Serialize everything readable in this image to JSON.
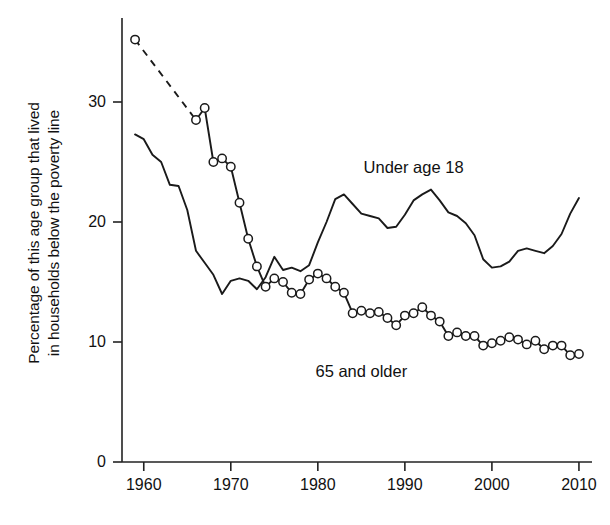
{
  "chart_data": {
    "type": "line",
    "title": "",
    "subtitle": "",
    "xlabel": "",
    "ylabel": "Percentage of this age group that lived in households below the poverty line",
    "ylabel_line1": "Percentage of this age group that lived",
    "ylabel_line2": "in households below the poverty line",
    "xlim": [
      1957.5,
      2011.5
    ],
    "ylim": [
      0,
      37
    ],
    "xticks": [
      1960,
      1970,
      1980,
      1990,
      2000,
      2010
    ],
    "yticks": [
      0,
      10,
      20,
      30
    ],
    "xtick_labels": [
      "1960",
      "1970",
      "1980",
      "1990",
      "2000",
      "2010"
    ],
    "ytick_labels": [
      "0",
      "10",
      "20",
      "30"
    ],
    "grid": false,
    "legend_position": "inline-annotations",
    "annotations": [
      {
        "text": "Under age 18",
        "x": 1991.0,
        "y": 24.6
      },
      {
        "text": "65 and older",
        "x": 1985.0,
        "y": 7.6
      }
    ],
    "series": [
      {
        "name": "Under age 18",
        "marker": "none",
        "line_style": "solid",
        "color": "#1a1a1a",
        "x": [
          1959,
          1960,
          1961,
          1962,
          1963,
          1964,
          1965,
          1966,
          1967,
          1968,
          1969,
          1970,
          1971,
          1972,
          1973,
          1974,
          1975,
          1976,
          1977,
          1978,
          1979,
          1980,
          1981,
          1982,
          1983,
          1984,
          1985,
          1986,
          1987,
          1988,
          1989,
          1990,
          1991,
          1992,
          1993,
          1994,
          1995,
          1996,
          1997,
          1998,
          1999,
          2000,
          2001,
          2002,
          2003,
          2004,
          2005,
          2006,
          2007,
          2008,
          2009,
          2010
        ],
        "values": [
          27.3,
          26.9,
          25.6,
          25.0,
          23.1,
          23.0,
          21.0,
          17.6,
          16.6,
          15.6,
          14.0,
          15.1,
          15.3,
          15.1,
          14.4,
          15.4,
          17.1,
          16.0,
          16.2,
          15.9,
          16.4,
          18.3,
          20.0,
          21.9,
          22.3,
          21.5,
          20.7,
          20.5,
          20.3,
          19.5,
          19.6,
          20.6,
          21.8,
          22.3,
          22.7,
          21.8,
          20.8,
          20.5,
          19.9,
          18.9,
          16.9,
          16.2,
          16.3,
          16.7,
          17.6,
          17.8,
          17.6,
          17.4,
          18.0,
          19.0,
          20.7,
          22.0
        ]
      },
      {
        "name": "65 and older",
        "marker": "open-circle",
        "line_style": "solid",
        "dashed_segment": [
          1959,
          1966
        ],
        "color": "#1a1a1a",
        "x": [
          1959,
          1966,
          1967,
          1968,
          1969,
          1970,
          1971,
          1972,
          1973,
          1974,
          1975,
          1976,
          1977,
          1978,
          1979,
          1980,
          1981,
          1982,
          1983,
          1984,
          1985,
          1986,
          1987,
          1988,
          1989,
          1990,
          1991,
          1992,
          1993,
          1994,
          1995,
          1996,
          1997,
          1998,
          1999,
          2000,
          2001,
          2002,
          2003,
          2004,
          2005,
          2006,
          2007,
          2008,
          2009,
          2010
        ],
        "values": [
          35.2,
          28.5,
          29.5,
          25.0,
          25.3,
          24.6,
          21.6,
          18.6,
          16.3,
          14.6,
          15.3,
          15.0,
          14.1,
          14.0,
          15.2,
          15.7,
          15.3,
          14.6,
          14.1,
          12.4,
          12.6,
          12.4,
          12.5,
          12.0,
          11.4,
          12.2,
          12.4,
          12.9,
          12.2,
          11.7,
          10.5,
          10.8,
          10.5,
          10.5,
          9.7,
          9.9,
          10.1,
          10.4,
          10.2,
          9.8,
          10.1,
          9.4,
          9.7,
          9.7,
          8.9,
          9.0
        ]
      }
    ]
  },
  "axis": {
    "y_title_line1": "Percentage of this age group that lived",
    "y_title_line2": "in households below the poverty line"
  }
}
